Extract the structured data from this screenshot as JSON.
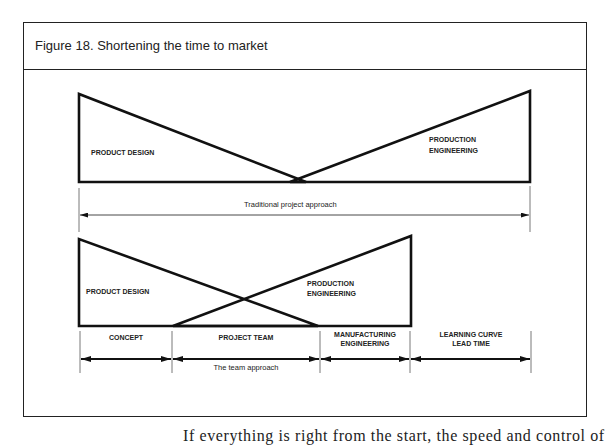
{
  "figure": {
    "title": "Figure 18. Shortening the time to market"
  },
  "traditional": {
    "product_design_label": "PRODUCT DESIGN",
    "production_engineering_label_1": "PRODUCTION",
    "production_engineering_label_2": "ENGINEERING",
    "span_caption": "Traditional project approach"
  },
  "team": {
    "product_design_label": "PRODUCT DESIGN",
    "production_engineering_label_1": "PRODUCTION",
    "production_engineering_label_2": "ENGINEERING",
    "phases": [
      {
        "label_1": "CONCEPT",
        "label_2": ""
      },
      {
        "label_1": "PROJECT TEAM",
        "label_2": ""
      },
      {
        "label_1": "MANUFACTURING",
        "label_2": "ENGINEERING"
      },
      {
        "label_1": "LEARNING CURVE",
        "label_2": "LEAD TIME"
      }
    ],
    "span_caption": "The team approach"
  },
  "body_text": "If everything is right from the start, the speed and control of"
}
